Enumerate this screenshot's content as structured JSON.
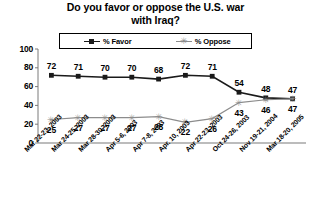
{
  "chart_data": {
    "type": "line",
    "title": "Do you favor or oppose the U.S. war with Iraq?",
    "title_line1": "Do you favor or oppose the U.S. war",
    "title_line2": "with Iraq?",
    "xlabel": "",
    "ylabel": "",
    "ylim": [
      0,
      100
    ],
    "yticks": [
      0,
      20,
      40,
      60,
      80,
      100
    ],
    "grid": false,
    "legend_position": "top",
    "categories": [
      "Mar 22-23, 2003",
      "Mar 24-25, 2003",
      "Mar 28-30, 2003",
      "Apr 5-6, 2003",
      "Apr 7-8, 2003",
      "Apr. 10, 2003",
      "Apr 22-23, 2003",
      "Oct 24-26, 2003",
      "Nov 19-21, 2004",
      "Mar 18-20, 2005"
    ],
    "series": [
      {
        "name": "% Favor",
        "color": "#1a1a1a",
        "marker": "square",
        "values": [
          72,
          71,
          70,
          70,
          68,
          72,
          71,
          54,
          48,
          47
        ]
      },
      {
        "name": "% Oppose",
        "color": "#8c8c8c",
        "marker": "star",
        "values": [
          25,
          27,
          27,
          27,
          28,
          22,
          26,
          43,
          46,
          47
        ]
      }
    ]
  },
  "legend": {
    "favor_label": "% Favor",
    "oppose_label": "% Oppose",
    "star_glyph": "✳"
  },
  "axis": {
    "tick_labels": [
      "100",
      "80",
      "60",
      "40",
      "20",
      "0"
    ]
  }
}
